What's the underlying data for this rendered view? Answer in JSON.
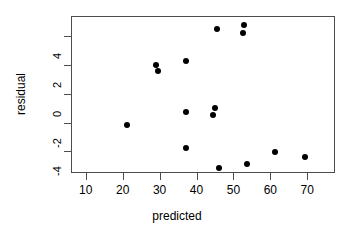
{
  "chart_data": {
    "type": "scatter",
    "title": "",
    "xlabel": "predicted",
    "ylabel": "residual",
    "xlim": [
      6,
      77.5
    ],
    "ylim": [
      -5.5,
      5.4
    ],
    "xticks": [
      10,
      20,
      30,
      40,
      50,
      60,
      70
    ],
    "xtick_labels": [
      "10",
      "20",
      "30",
      "40",
      "50",
      "60",
      "70"
    ],
    "yticks": [
      4,
      2,
      0,
      -2,
      -4
    ],
    "ytick_labels": [
      "4",
      "2",
      "0",
      "-2",
      "-4"
    ],
    "grid": false,
    "legend": null,
    "marker": "filled-circle",
    "marker_color": "#000000",
    "points": [
      {
        "x": 21.0,
        "y": -2.1
      },
      {
        "x": 28.8,
        "y": 2.1
      },
      {
        "x": 29.2,
        "y": 1.65
      },
      {
        "x": 37.0,
        "y": 2.35
      },
      {
        "x": 36.8,
        "y": -1.2
      },
      {
        "x": 36.8,
        "y": -3.7
      },
      {
        "x": 44.6,
        "y": -0.95
      },
      {
        "x": 44.3,
        "y": -1.4
      },
      {
        "x": 45.4,
        "y": 4.6
      },
      {
        "x": 45.8,
        "y": -5.1
      },
      {
        "x": 52.3,
        "y": 4.3
      },
      {
        "x": 52.6,
        "y": 4.85
      },
      {
        "x": 53.5,
        "y": -4.8
      },
      {
        "x": 61.0,
        "y": -4.0
      },
      {
        "x": 69.2,
        "y": -4.3
      }
    ]
  }
}
